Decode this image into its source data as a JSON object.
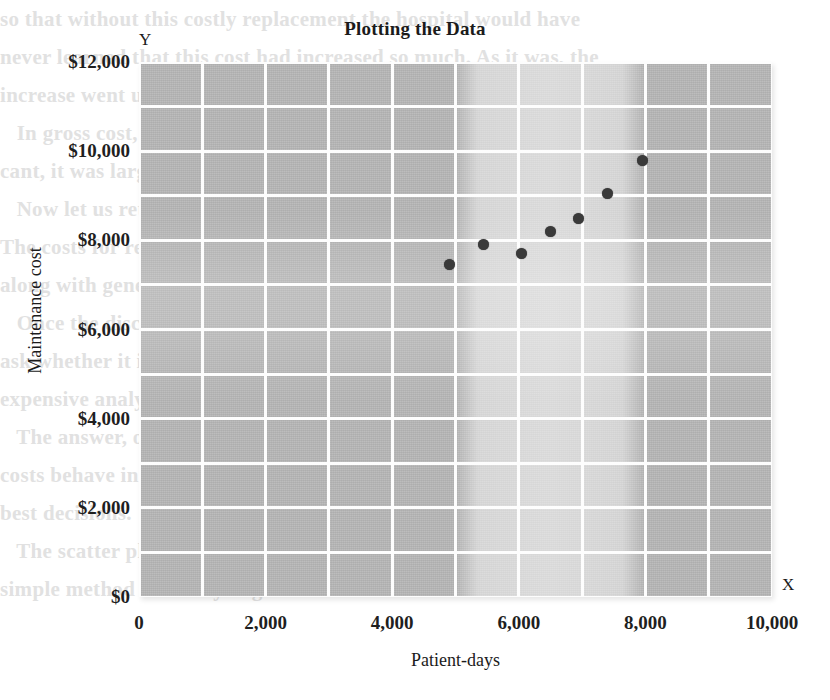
{
  "chart_data": {
    "type": "scatter",
    "title": "Plotting the Data",
    "xlabel": "Patient-days",
    "ylabel": "Maintenance cost",
    "x_axis_marker": "X",
    "y_axis_marker": "Y",
    "xlim": [
      0,
      10000
    ],
    "ylim": [
      0,
      12000
    ],
    "xticks": [
      0,
      2000,
      4000,
      6000,
      8000,
      10000
    ],
    "xticklabels": [
      "0",
      "2,000",
      "4,000",
      "6,000",
      "8,000",
      "10,000"
    ],
    "yticks": [
      0,
      2000,
      4000,
      6000,
      8000,
      10000,
      12000
    ],
    "yticklabels": [
      "$0",
      "$2,000",
      "$4,000",
      "$6,000",
      "$8,000",
      "$10,000",
      "$12,000"
    ],
    "grid": true,
    "grid_columns": 10,
    "grid_rows": 12,
    "grid_x_step": 1000,
    "grid_y_step": 1000,
    "legend": null,
    "series": [
      {
        "name": "Maintenance cost vs patient-days",
        "marker": "filled-circle",
        "color": "#3a3a3a",
        "points": [
          {
            "x": 4900,
            "y": 7450
          },
          {
            "x": 5450,
            "y": 7900
          },
          {
            "x": 6050,
            "y": 7700
          },
          {
            "x": 6500,
            "y": 8200
          },
          {
            "x": 6950,
            "y": 8500
          },
          {
            "x": 7400,
            "y": 9050
          },
          {
            "x": 7950,
            "y": 9800
          }
        ]
      }
    ]
  },
  "style": {
    "plot_background": "#b9b9b9",
    "gridline_color": "#fdfdfd",
    "marker_color": "#3a3a3a",
    "text_color": "#1b1b1b",
    "page_background": "#ffffff"
  },
  "bleed_text": [
    "so that without this costly replacement the hospital would have",
    "never learned that this cost had increased so much. As it was, the",
    "increase went unnoticed.",
    "   In gross cost, the Christmas budget was not only signifi-",
    "cant, it was large. But how can we account for it; can it overflow?",
    "",
    "   Now let us return to the idea of cost behavior and costs.",
    "The costs for replacement can be included in the total cost",
    "along with general maintenance, supplies and upkeep.",
    "   Once the discussion is well under way, the instructor may",
    "ask whether it is necessary to be concerned with such an",
    "expensive analysis.",
    "",
    "   The answer, of course, is that one must understand how",
    "costs behave in order to control them and to make the",
    "best decisions.",
    "",
    "   The scatter plot shown below is a good example of a",
    "simple method for analyzing mixed costs."
  ]
}
